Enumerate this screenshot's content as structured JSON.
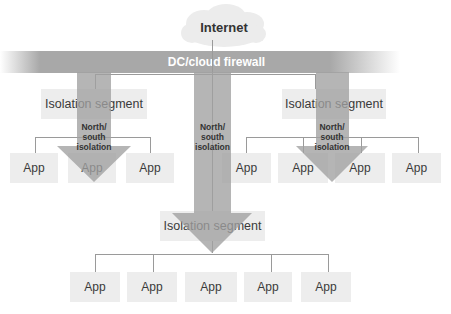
{
  "internet": {
    "label": "Internet",
    "icon": "cloud-icon"
  },
  "firewall": {
    "label": "DC/cloud firewall"
  },
  "arrow_label": [
    "North/",
    "south",
    "isolation"
  ],
  "segments": {
    "left": {
      "label": "Isolation segment",
      "apps": [
        "App",
        "App",
        "App"
      ]
    },
    "right": {
      "label": "Isolation segment",
      "apps": [
        "App",
        "App",
        "App",
        "App"
      ]
    },
    "center": {
      "label": "Isolation segment",
      "apps": [
        "App",
        "App",
        "App",
        "App",
        "App"
      ]
    }
  },
  "colors": {
    "box": "#ededed",
    "arrow": "#a8a8a8",
    "line": "#9a9a9a",
    "text": "#3a3a3a"
  }
}
